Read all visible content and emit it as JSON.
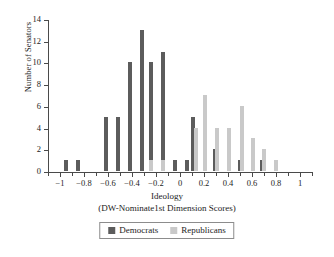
{
  "chart_data": {
    "type": "bar",
    "title": "",
    "subtitle": "",
    "xlabel": "Ideology",
    "xlabel_sub": "(DW-Nominate1st Dimension Scores)",
    "ylabel": "Number of Senators",
    "xlim": [
      -1.1,
      1.1
    ],
    "ylim": [
      0,
      14
    ],
    "ytick_step": 2,
    "xtick_step": 0.2,
    "x_minor_step": 0.1,
    "grid": false,
    "legend_position": "bottom-center",
    "bin_width": 0.05,
    "yticks": [
      "0",
      "2",
      "4",
      "6",
      "8",
      "10",
      "12",
      "14"
    ],
    "ytick_values": [
      0,
      2,
      4,
      6,
      8,
      10,
      12,
      14
    ],
    "xticks": [
      "−1",
      "−0.8",
      "−0.6",
      "−0.4",
      "−0.2",
      "0",
      "0.2",
      "0.4",
      "0.6",
      "0.8",
      "1"
    ],
    "xtick_values": [
      -1,
      -0.8,
      -0.6,
      -0.4,
      -0.2,
      0,
      0.2,
      0.4,
      0.6,
      0.8,
      1
    ],
    "series": [
      {
        "name": "Democrats",
        "color": "#5c5c5c",
        "x": [
          -0.95,
          -0.85,
          -0.62,
          -0.52,
          -0.42,
          -0.32,
          -0.24,
          -0.14,
          -0.04,
          0.06,
          0.11,
          0.21,
          0.29,
          0.5,
          0.68
        ],
        "values": [
          1,
          1,
          5,
          5,
          10,
          13,
          10,
          11,
          1,
          1,
          5,
          3,
          2,
          1,
          1
        ]
      },
      {
        "name": "Republicans",
        "color": "#c9c9c9",
        "x": [
          -0.24,
          -0.14,
          0.13,
          0.21,
          0.31,
          0.41,
          0.52,
          0.61,
          0.7,
          0.8
        ],
        "values": [
          1,
          1,
          4,
          7,
          4,
          4,
          6,
          3,
          2,
          1
        ]
      }
    ]
  },
  "legend": {
    "items": [
      {
        "label": "Democrats",
        "swatch": "dem"
      },
      {
        "label": "Republicans",
        "swatch": "rep"
      }
    ]
  }
}
